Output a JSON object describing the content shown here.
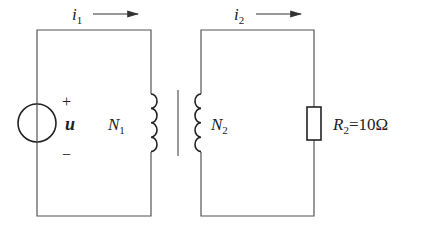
{
  "diagram": {
    "type": "transformer-circuit",
    "primary": {
      "current_label": "i",
      "current_sub": "1",
      "source_label": "u",
      "polarity_plus": "+",
      "polarity_minus": "−",
      "winding_label": "N",
      "winding_sub": "1"
    },
    "secondary": {
      "current_label": "i",
      "current_sub": "2",
      "winding_label": "N",
      "winding_sub": "2",
      "resistor_label": "R",
      "resistor_sub": "2",
      "resistor_value": "=10Ω"
    },
    "colors": {
      "wire": "#555555",
      "component": "#222222",
      "background": "#ffffff"
    }
  }
}
